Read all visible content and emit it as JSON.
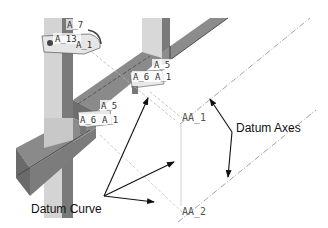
{
  "diagram": {
    "type": "cad-model-annotation",
    "colors": {
      "background": "#ffffff",
      "frame_light": "#d4d4d4",
      "frame_mid": "#9a9a9a",
      "frame_dark": "#6e6e6e",
      "axis_line": "#8a8a8a",
      "arrow": "#111111",
      "bracket": "#e6e6e6"
    },
    "callouts": {
      "datum_axes": "Datum Axes",
      "datum_curve": "Datum Curve"
    },
    "axis_labels": {
      "aa1": "AA_1",
      "aa2": "AA_2"
    },
    "feature_tags": {
      "top_a7": "A_7",
      "top_a13": "A_13",
      "top_a1": "A_1",
      "mid_a5": "A_5",
      "mid_a6": "A_6",
      "mid_a1": "A_1",
      "low_a5": "A_5",
      "low_a6": "A_6",
      "low_a1": "A_1"
    }
  }
}
